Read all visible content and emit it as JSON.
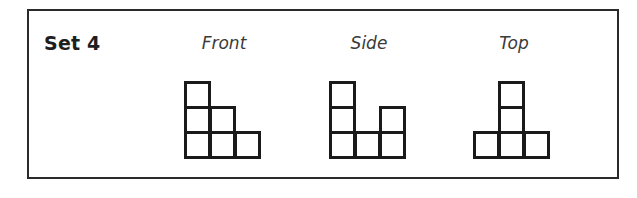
{
  "set": {
    "title": "Set 4"
  },
  "views": [
    {
      "label": "Front",
      "cells": [
        [
          0,
          0
        ],
        [
          0,
          1
        ],
        [
          1,
          1
        ],
        [
          0,
          2
        ],
        [
          1,
          2
        ],
        [
          2,
          2
        ]
      ]
    },
    {
      "label": "Side",
      "cells": [
        [
          0,
          0
        ],
        [
          0,
          1
        ],
        [
          2,
          1
        ],
        [
          0,
          2
        ],
        [
          1,
          2
        ],
        [
          2,
          2
        ]
      ]
    },
    {
      "label": "Top",
      "cells": [
        [
          1,
          0
        ],
        [
          1,
          1
        ],
        [
          0,
          2
        ],
        [
          1,
          2
        ],
        [
          2,
          2
        ]
      ]
    }
  ],
  "colors": {
    "line": "#1a1a1a",
    "border": "#2a2a2a"
  }
}
